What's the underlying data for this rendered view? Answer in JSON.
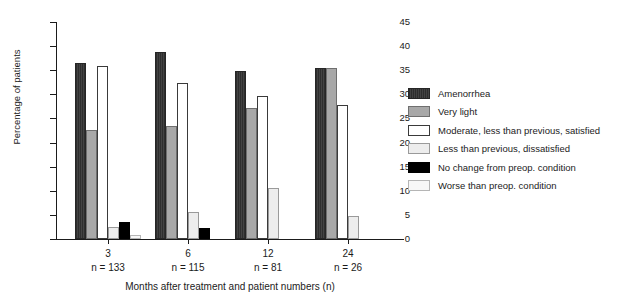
{
  "chart_data": {
    "type": "bar",
    "title": "",
    "xlabel": "Months after treatment and patient numbers (n)",
    "ylabel": "Percentage of patients",
    "ylim": [
      0,
      45
    ],
    "yticks": [
      0,
      5,
      10,
      15,
      20,
      25,
      30,
      35,
      40,
      45
    ],
    "grid": false,
    "legend_position": "right",
    "categories": [
      "3",
      "6",
      "12",
      "24"
    ],
    "category_sublabels": [
      "n = 133",
      "n = 115",
      "n = 81",
      "n = 26"
    ],
    "series": [
      {
        "name": "Amenorrhea",
        "color": "#3a3a3a",
        "values": [
          36.5,
          38.8,
          34.8,
          35.4
        ]
      },
      {
        "name": "Very light",
        "color": "#a8a8a8",
        "values": [
          22.7,
          23.5,
          27.2,
          35.4
        ]
      },
      {
        "name": "Moderate, less than previous, satisfied",
        "color": "#ffffff",
        "values": [
          35.9,
          32.3,
          29.6,
          27.8
        ]
      },
      {
        "name": "Less than previous, dissatisfied",
        "color": "#ededed",
        "values": [
          2.5,
          5.5,
          10.5,
          4.8
        ]
      },
      {
        "name": "No change from preop. condition",
        "color": "#000000",
        "values": [
          3.5,
          2.3,
          0,
          0
        ]
      },
      {
        "name": "Worse than preop. condition",
        "color": "#f7f7f7",
        "values": [
          0.8,
          0,
          0,
          0
        ]
      }
    ]
  },
  "legend": {
    "items": [
      {
        "label": "Amenorrhea"
      },
      {
        "label": "Very light"
      },
      {
        "label": "Moderate, less than previous, satisfied"
      },
      {
        "label": "Less than previous, dissatisfied"
      },
      {
        "label": "No change from preop. condition"
      },
      {
        "label": "Worse than preop. condition"
      }
    ]
  }
}
